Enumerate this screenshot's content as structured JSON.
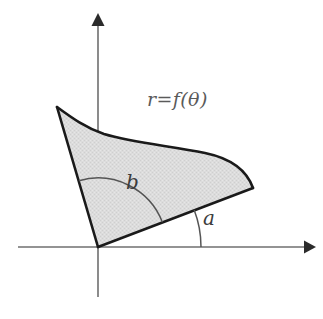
{
  "figure": {
    "background_color": "#ffffff",
    "labels": {
      "curve_equation": "r=f(θ)",
      "angle_outer": "b",
      "angle_inner": "a"
    },
    "colors": {
      "axis": "#6f6f6f",
      "boundary": "#1a1a1a",
      "region_fill": "#d9d9d9",
      "arc": "#555555",
      "label_text": "#4a4a4a"
    },
    "axes": {
      "origin": {
        "x": 98,
        "y": 247
      },
      "x_axis": {
        "x_start": 18,
        "x_end": 312,
        "y": 247,
        "arrow": "right"
      },
      "y_axis": {
        "x": 98,
        "y_start": 15,
        "y_end": 297,
        "arrow": "up"
      }
    },
    "region": {
      "type": "polar-sector",
      "inner_ray_angle_deg": 21,
      "outer_ray_angle_deg": 106,
      "inner_ray_end": {
        "x": 253,
        "y": 188
      },
      "outer_ray_end": {
        "x": 57,
        "y": 107
      },
      "fill": "#d9d9d9"
    },
    "angle_arcs": {
      "a": {
        "radius": 103,
        "from_deg": 0,
        "to_deg": 21
      },
      "b": {
        "radius": 69,
        "from_deg": 21,
        "to_deg": 106
      }
    }
  }
}
